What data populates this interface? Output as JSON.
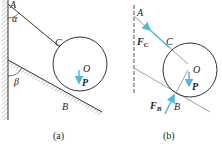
{
  "figure_a": {
    "caption": "(a)",
    "labels": {
      "A": "A",
      "C": "C",
      "O": "O",
      "P": "P",
      "B": "B",
      "alpha": "α",
      "beta": "β"
    }
  },
  "figure_b": {
    "caption": "(b)",
    "labels": {
      "A": "A",
      "C": "C",
      "O": "O",
      "P": "P",
      "B": "B",
      "FC": "F",
      "FC_sub": "C",
      "FB": "F",
      "FB_sub": "B"
    }
  },
  "colors": {
    "line": "#333333",
    "force": "#4db8e0",
    "hatch": "#888888"
  }
}
